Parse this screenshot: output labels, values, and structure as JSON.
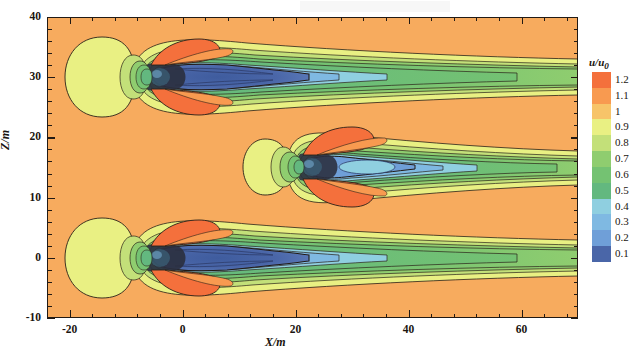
{
  "axes": {
    "xlabel": "X/m",
    "ylabel": "Z/m",
    "xticks": [
      "-20",
      "0",
      "20",
      "40",
      "60"
    ],
    "xtick_values": [
      -20,
      0,
      20,
      40,
      60
    ],
    "yticks": [
      "40",
      "30",
      "20",
      "10",
      "0",
      "-10"
    ],
    "ytick_values": [
      40,
      30,
      20,
      10,
      0,
      -10
    ],
    "xlim": [
      -24,
      70
    ],
    "ylim": [
      -10,
      40
    ],
    "xminor_step": 4,
    "yminor_step": 2
  },
  "colorbar": {
    "title": "u/u",
    "title_sub": "0",
    "labels": [
      "1.2",
      "1.1",
      "1",
      "0.9",
      "0.8",
      "0.7",
      "0.6",
      "0.5",
      "0.4",
      "0.3",
      "0.2",
      "0.1"
    ],
    "values": [
      1.2,
      1.1,
      1.0,
      0.9,
      0.8,
      0.7,
      0.6,
      0.5,
      0.4,
      0.3,
      0.2,
      0.1
    ],
    "colors": [
      "#f4703c",
      "#f89a50",
      "#f7c469",
      "#e9f083",
      "#c3e079",
      "#8fcd6f",
      "#74c272",
      "#63b87f",
      "#8fcfe0",
      "#7fb9e2",
      "#6f9fd8",
      "#4a66a8"
    ],
    "background_color": "#f7ab5e",
    "orientation": "vertical"
  },
  "chart_data": {
    "type": "heatmap",
    "title": "",
    "xlabel": "X/m",
    "ylabel": "Z/m",
    "xlim": [
      -24,
      70
    ],
    "ylim": [
      -10,
      40
    ],
    "grid": false,
    "legend_position": "right",
    "quantity": "u/u0",
    "contour_levels": [
      0.1,
      0.2,
      0.3,
      0.4,
      0.5,
      0.6,
      0.7,
      0.8,
      0.9,
      1.0,
      1.1,
      1.2
    ],
    "freestream_value": 1.05,
    "annotations": [
      "three wind-turbine wakes aligned streamwise at Z = 30, 15, 0 m",
      "upstream induction zone u/u0 ~ 0.9-1.0 (yellow) ahead of each rotor",
      "tip speed-up lobes u/u0 ~ 1.1-1.2 (orange-red) above and below each rotor",
      "near-wake velocity deficit core u/u0 ~ 0.1-0.3 (dark blue)",
      "far-wake recovery band u/u0 ~ 0.5-0.8 (green) extending to X = 70 m"
    ],
    "turbines": [
      {
        "name": "turbine-top",
        "x": 0,
        "z": 30,
        "rotor_radius": 4.0,
        "min_deficit": 0.15,
        "induction_radius": 12.5,
        "wake_core_color": "#4a66a8"
      },
      {
        "name": "turbine-middle",
        "x": 13,
        "z": 15,
        "rotor_radius": 4.0,
        "min_deficit": 0.3,
        "induction_radius": 7.0,
        "wake_core_color": "#7fb9e2"
      },
      {
        "name": "turbine-bottom",
        "x": 0,
        "z": 0,
        "rotor_radius": 4.0,
        "min_deficit": 0.15,
        "induction_radius": 12.5,
        "wake_core_color": "#4a66a8"
      }
    ],
    "series": [
      {
        "name": "centerline-deficit-top",
        "x": [
          0,
          5,
          10,
          20,
          30,
          45,
          60,
          70
        ],
        "values": [
          0.35,
          0.15,
          0.15,
          0.2,
          0.35,
          0.5,
          0.6,
          0.65
        ]
      },
      {
        "name": "centerline-deficit-middle",
        "x": [
          13,
          18,
          23,
          33,
          43,
          55,
          70
        ],
        "values": [
          0.35,
          0.3,
          0.3,
          0.4,
          0.5,
          0.6,
          0.65
        ]
      },
      {
        "name": "centerline-deficit-bottom",
        "x": [
          0,
          5,
          10,
          20,
          30,
          45,
          60,
          70
        ],
        "values": [
          0.35,
          0.15,
          0.15,
          0.2,
          0.35,
          0.5,
          0.6,
          0.65
        ]
      }
    ]
  }
}
